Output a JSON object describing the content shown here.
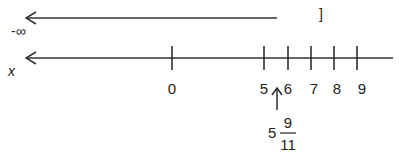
{
  "diagram": {
    "type": "number-line",
    "solution_ray": {
      "direction": "left",
      "start_label": "-∞",
      "end_bracket": "]"
    },
    "axis": {
      "variable_label": "x",
      "ticks": [
        {
          "value": "0",
          "x": 172
        },
        {
          "value": "5",
          "x": 264
        },
        {
          "value": "6",
          "x": 288
        },
        {
          "value": "7",
          "x": 311
        },
        {
          "value": "8",
          "x": 334
        },
        {
          "value": "9",
          "x": 357
        }
      ]
    },
    "marker": {
      "whole": "5",
      "numerator": "9",
      "denominator": "11"
    }
  }
}
